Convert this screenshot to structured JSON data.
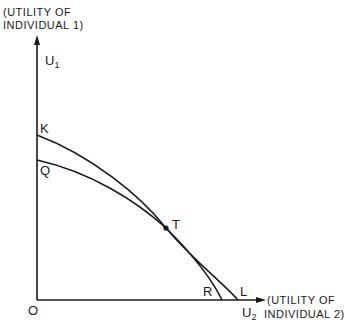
{
  "diagram": {
    "y_axis": {
      "title_line1": "(UTILITY OF",
      "title_line2": "INDIVIDUAL 1)",
      "symbol": "U",
      "subscript": "1"
    },
    "x_axis": {
      "title_line1": "(UTILITY OF",
      "title_line2": "INDIVIDUAL 2)",
      "symbol": "U",
      "subscript": "2"
    },
    "origin_label": "O",
    "points": {
      "K": "K",
      "Q": "Q",
      "T": "T",
      "R": "R",
      "L": "L"
    },
    "curves": [
      {
        "name": "KL",
        "from": "K",
        "to": "L"
      },
      {
        "name": "QR",
        "from": "Q",
        "to": "R"
      }
    ],
    "colors": {
      "ink": "#1a1a1a",
      "background": "#ffffff"
    }
  }
}
